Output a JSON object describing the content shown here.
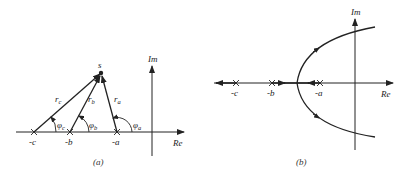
{
  "panel_a": {
    "caption": "(a)",
    "point_label": "s",
    "axis_re": "Re",
    "axis_im": "Im",
    "poles": [
      {
        "label": "-c",
        "x": 34
      },
      {
        "label": "-b",
        "x": 70
      },
      {
        "label": "-a",
        "x": 117
      }
    ],
    "vectors": [
      {
        "label": "r_c",
        "sub": "c"
      },
      {
        "label": "r_b",
        "sub": "b"
      },
      {
        "label": "r_a",
        "sub": "a"
      }
    ],
    "angles": [
      {
        "label": "φ_c",
        "sym": "φ",
        "sub": "c"
      },
      {
        "label": "φ_b",
        "sym": "φ",
        "sub": "b"
      },
      {
        "label": "φ_a",
        "sym": "φ",
        "sub": "a"
      }
    ]
  },
  "panel_b": {
    "caption": "(b)",
    "axis_re": "Re",
    "axis_im": "Im",
    "poles": [
      {
        "label": "-c",
        "x": 236
      },
      {
        "label": "-b",
        "x": 272
      },
      {
        "label": "-a",
        "x": 320
      }
    ]
  }
}
